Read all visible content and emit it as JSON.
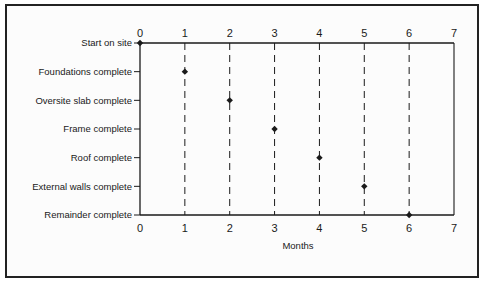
{
  "chart_data": {
    "type": "scatter",
    "title": "",
    "xlabel": "Months",
    "ylabel": "",
    "xlim": [
      0,
      7
    ],
    "x_ticks": [
      0,
      1,
      2,
      3,
      4,
      5,
      6,
      7
    ],
    "x_tick_labels_top": [
      "0",
      "1",
      "2",
      "3",
      "4",
      "5",
      "6",
      "7"
    ],
    "x_tick_labels_bottom": [
      "0",
      "1",
      "2",
      "3",
      "4",
      "5",
      "6",
      "7"
    ],
    "categories": [
      "Start on site",
      "Foundations complete",
      "Oversite slab complete",
      "Frame complete",
      "Roof complete",
      "External walls complete",
      "Remainder complete"
    ],
    "values": [
      0,
      1,
      2,
      3,
      4,
      5,
      6
    ],
    "grid": "vertical dashed lines at months 1-6",
    "marker": "diamond",
    "legend": null
  },
  "colors": {
    "ink": "#1a1a1a",
    "frame": "#222222",
    "background": "#fcfcfc"
  }
}
